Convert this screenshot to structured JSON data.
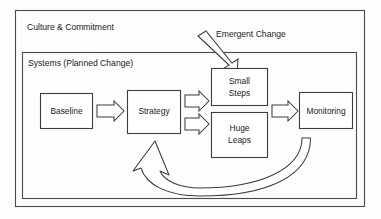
{
  "diagram": {
    "title_outer": "Culture & Commitment",
    "title_inner": "Systems (Planned Change)",
    "callout": "Emergent Change",
    "nodes": {
      "baseline": "Baseline",
      "strategy": "Strategy",
      "small_steps_line1": "Small",
      "small_steps_line2": "Steps",
      "huge_leaps_line1": "Huge",
      "huge_leaps_line2": "Leaps",
      "monitoring": "Monitoring"
    },
    "colors": {
      "stroke": "#3c3c3c",
      "frame_stroke": "#4a4a4a",
      "fill": "#ffffff",
      "text": "#1a1a1a",
      "background": "#fdfdfd"
    }
  }
}
